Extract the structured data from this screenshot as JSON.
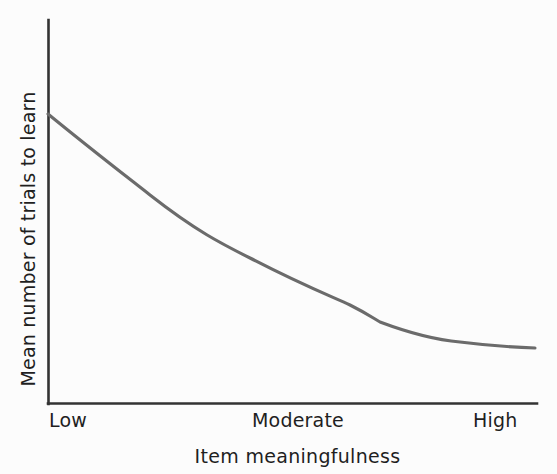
{
  "chart_data": {
    "type": "line",
    "title": "",
    "xlabel": "Item meaningfulness",
    "ylabel": "Mean number of trials to learn",
    "xtick_labels": [
      "Low",
      "Moderate",
      "High"
    ],
    "ytick_labels": [],
    "grid": false,
    "legend": false,
    "xlim": [
      0,
      1
    ],
    "ylim": [
      0,
      1
    ],
    "series": [
      {
        "name": "mean trials to learn",
        "comment": "Monotonically decreasing, decelerating curve that flattens toward an asymptote at high item meaningfulness.",
        "x": [
          0.0,
          0.1,
          0.21,
          0.41,
          0.62,
          0.68,
          0.84,
          1.0
        ],
        "y": [
          1.0,
          0.79,
          0.63,
          0.47,
          0.35,
          0.3,
          0.23,
          0.21
        ],
        "x_pixels": [
          48,
          98,
          150,
          250,
          350,
          380,
          460,
          535
        ],
        "y_pixels": [
          114,
          155,
          195,
          258,
          305,
          322,
          342,
          348
        ],
        "color": "#6b6b6b",
        "linewidth": 3
      }
    ],
    "annotations": [],
    "axis_color": "#333333",
    "background_color": "#fcfcfc"
  },
  "axes": {
    "x_labels": {
      "low": "Low",
      "moderate": "Moderate",
      "high": "High"
    },
    "x_title": "Item meaningfulness",
    "y_title": "Mean number of trials to learn"
  },
  "path": {
    "curve_d": "M 48 114 C 92 150, 122 173, 150 195 C 196 231, 222 244, 250 258 C 300 284, 328 295, 350 305 C 366 313, 373 318, 380 322 C 412 334, 437 340, 460 342 C 492 346, 518 347.5, 535 348",
    "y_axis_d": "M 48.5 20 L 48.5 404",
    "x_axis_d": "M 48 403.5 L 537 403.5"
  }
}
